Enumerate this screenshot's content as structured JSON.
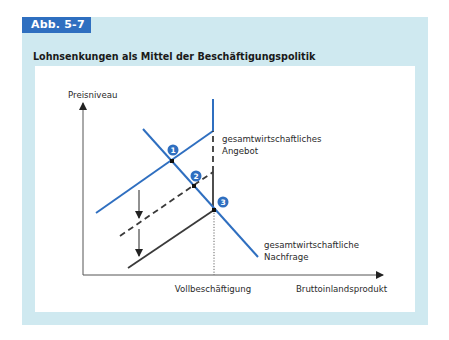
{
  "figure": {
    "tag": "Abb. 5-7",
    "title": "Lohnsenkungen als Mittel der Beschäftigungspolitik"
  },
  "colors": {
    "frame_bg": "#cfe9f0",
    "tag_bg": "#2f6fc0",
    "curve_blue": "#2f6fc0",
    "curve_dark": "#3a3a3a",
    "axis": "#333333"
  },
  "diagram": {
    "y_axis_label": "Preisniveau",
    "x_axis_label": "Bruttoinlandsprodukt",
    "x_marker_label": "Vollbeschäftigung",
    "supply_label_line1": "gesamtwirtschaftliches",
    "supply_label_line2": "Angebot",
    "demand_label_line1": "gesamtwirtschaftliche",
    "demand_label_line2": "Nachfrage",
    "points": [
      {
        "id": "1",
        "label": "1"
      },
      {
        "id": "2",
        "label": "2"
      },
      {
        "id": "3",
        "label": "3"
      }
    ],
    "curves": [
      {
        "name": "Angebot (ursprünglich)",
        "style": "solid-blue"
      },
      {
        "name": "Angebot (nach 1. Lohnsenkung)",
        "style": "dashed-dark"
      },
      {
        "name": "Angebot (nach 2. Lohnsenkung)",
        "style": "solid-dark"
      },
      {
        "name": "Nachfrage",
        "style": "solid-blue"
      }
    ],
    "shift_arrows": 2
  }
}
